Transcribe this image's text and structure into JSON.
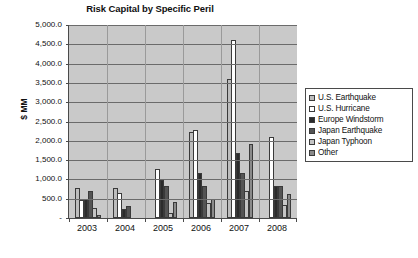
{
  "chart_data": {
    "type": "bar",
    "title": "Risk Capital by Specific Peril",
    "xlabel": "",
    "ylabel": "$ MM",
    "ylim": [
      0,
      5000
    ],
    "ytick_labels": [
      "5,000.0",
      "4,500.0",
      "4,000.0",
      "3,500.0",
      "3,000.0",
      "2,500.0",
      "2,000.0",
      "1,500.0",
      "1,000.0",
      "500.0",
      "-"
    ],
    "ytick_values": [
      5000,
      4500,
      4000,
      3500,
      3000,
      2500,
      2000,
      1500,
      1000,
      500,
      0
    ],
    "grid": true,
    "legend_position": "right",
    "categories": [
      "2003",
      "2004",
      "2005",
      "2006",
      "2007",
      "2008"
    ],
    "series": [
      {
        "name": "U.S. Earthquake",
        "color": "#bdbdbd",
        "values": [
          790,
          780,
          0,
          2230,
          3605,
          0
        ]
      },
      {
        "name": "U.S. Hurricane",
        "color": "#ffffff",
        "values": [
          460,
          650,
          1265,
          2270,
          4620,
          2110
        ]
      },
      {
        "name": "Europe Windstorm",
        "color": "#2b2b2b",
        "values": [
          480,
          235,
          980,
          1160,
          1675,
          840
        ]
      },
      {
        "name": "Japan Earthquake",
        "color": "#545454",
        "values": [
          690,
          320,
          820,
          820,
          1165,
          835
        ]
      },
      {
        "name": "Japan Typhoon",
        "color": "#c4c4c4",
        "values": [
          255,
          0,
          140,
          400,
          700,
          330
        ]
      },
      {
        "name": "Other",
        "color": "#8a8a8a",
        "values": [
          90,
          0,
          405,
          500,
          1905,
          630
        ]
      }
    ]
  }
}
